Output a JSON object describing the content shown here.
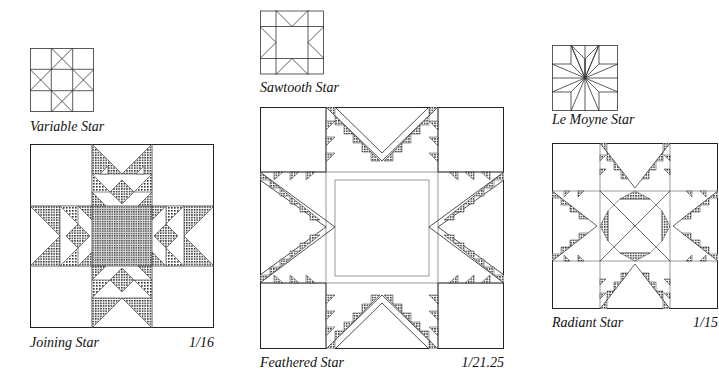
{
  "figures": [
    {
      "id": "variable-star",
      "label": "Variable Star",
      "type": "thumbnail"
    },
    {
      "id": "joining-star",
      "label": "Joining Star",
      "scale": "1/16",
      "type": "block"
    },
    {
      "id": "sawtooth-star",
      "label": "Sawtooth Star",
      "type": "thumbnail"
    },
    {
      "id": "feathered-star",
      "label": "Feathered Star",
      "scale": "1/21.25",
      "type": "block"
    },
    {
      "id": "le-moyne-star",
      "label": "Le Moyne Star",
      "type": "thumbnail"
    },
    {
      "id": "radiant-star",
      "label": "Radiant Star",
      "scale": "1/15",
      "type": "block"
    }
  ],
  "colors": {
    "line": "#222222",
    "shade": "#8a8a8a",
    "background": "#ffffff"
  }
}
